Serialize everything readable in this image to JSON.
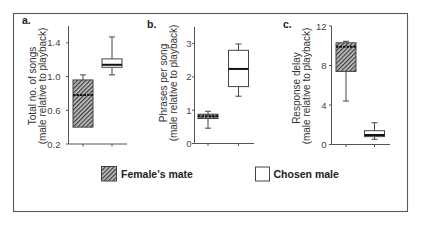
{
  "legend": {
    "items": [
      {
        "label": "Female's mate",
        "swatch": "hatched"
      },
      {
        "label": "Chosen male",
        "swatch": "open"
      }
    ]
  },
  "colors": {
    "frame": "#5a5a5a",
    "axis": "#555555",
    "box_stroke": "#444444",
    "hatch_fill": "#c4c4c4",
    "hatch_line": "#3a3a3a",
    "median": "#111111",
    "open_fill": "#ffffff"
  },
  "chart_data": [
    {
      "type": "box",
      "title": "a.",
      "ylabel": "Total no. of songs (male relative to playback)",
      "ylabel_lines": [
        "Total no. of songs",
        "(male relative to playback)"
      ],
      "xlabel": "",
      "categories": [
        "Female's mate",
        "Chosen male"
      ],
      "ylim": [
        0.2,
        1.6
      ],
      "yticks": [
        0.2,
        0.6,
        1.0,
        1.4
      ],
      "ytick_labels": [
        "0.2",
        "0.6",
        "1.0",
        "1.4"
      ],
      "grid": false,
      "legend_position": "bottom",
      "series": [
        {
          "name": "Female's mate",
          "fill": "hatched",
          "min": 0.4,
          "q1": 0.4,
          "median": 0.78,
          "q3": 0.96,
          "max": 1.02
        },
        {
          "name": "Chosen male",
          "fill": "open",
          "min": 1.02,
          "q1": 1.11,
          "median": 1.14,
          "q3": 1.21,
          "max": 1.47
        }
      ]
    },
    {
      "type": "box",
      "title": "b.",
      "ylabel": "Phrases per song (male relative to playback)",
      "ylabel_lines": [
        "Phrases per song",
        "(male relative to playback)"
      ],
      "xlabel": "",
      "categories": [
        "Female's mate",
        "Chosen male"
      ],
      "ylim": [
        0,
        3.5
      ],
      "yticks": [
        0,
        1,
        2,
        3
      ],
      "ytick_labels": [
        "0",
        "1",
        "2",
        "3"
      ],
      "grid": false,
      "legend_position": "bottom",
      "series": [
        {
          "name": "Female's mate",
          "fill": "hatched",
          "min": 0.46,
          "q1": 0.75,
          "median": 0.82,
          "q3": 0.88,
          "max": 0.97
        },
        {
          "name": "Chosen male",
          "fill": "open",
          "min": 1.42,
          "q1": 1.71,
          "median": 2.24,
          "q3": 2.8,
          "max": 2.99
        }
      ]
    },
    {
      "type": "box",
      "title": "c.",
      "ylabel": "Response delay (male relative to playback)",
      "ylabel_lines": [
        "Response delay",
        "(male relative to playback)"
      ],
      "xlabel": "",
      "categories": [
        "Female's mate",
        "Chosen male"
      ],
      "ylim": [
        0,
        12
      ],
      "yticks": [
        0,
        4,
        8,
        12
      ],
      "ytick_labels": [
        "0",
        "4",
        "8",
        "12"
      ],
      "grid": false,
      "legend_position": "bottom",
      "series": [
        {
          "name": "Female's mate",
          "fill": "hatched",
          "min": 4.4,
          "q1": 7.4,
          "median": 9.9,
          "q3": 10.3,
          "max": 10.45
        },
        {
          "name": "Chosen male",
          "fill": "open",
          "min": 0.53,
          "q1": 0.8,
          "median": 0.96,
          "q3": 1.4,
          "max": 2.2
        }
      ]
    }
  ]
}
